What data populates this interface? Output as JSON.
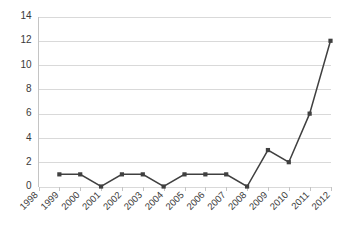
{
  "chart_data": {
    "type": "line",
    "title": "",
    "subtitle": "",
    "xlabel": "",
    "ylabel": "",
    "categories": [
      "1998",
      "1999",
      "2000",
      "2001",
      "2002",
      "2003",
      "2004",
      "2005",
      "2006",
      "2007",
      "2008",
      "2009",
      "2010",
      "2011",
      "2012"
    ],
    "values": [
      null,
      1,
      1,
      0,
      1,
      1,
      0,
      1,
      1,
      1,
      0,
      3,
      2,
      6,
      12
    ],
    "series": [
      {
        "name": "",
        "values": [
          null,
          1,
          1,
          0,
          1,
          1,
          0,
          1,
          1,
          1,
          0,
          3,
          2,
          6,
          12
        ]
      }
    ],
    "ylim": [
      0,
      14
    ],
    "yticks": [
      0,
      2,
      4,
      6,
      8,
      10,
      12,
      14
    ],
    "ytick_labels": [
      "0",
      "2",
      "4",
      "6",
      "8",
      "10",
      "12",
      "14"
    ],
    "grid": true,
    "grid_axis": "y",
    "legend": false,
    "legend_position": "none",
    "markers": true,
    "xtick_rotation": 45,
    "annotations": []
  },
  "style": {
    "series_color": "#404040",
    "grid_color": "#d9d9d9",
    "axis_color": "#c4c4c4",
    "text_color": "#3a3a3a",
    "background_color": "#ffffff"
  }
}
